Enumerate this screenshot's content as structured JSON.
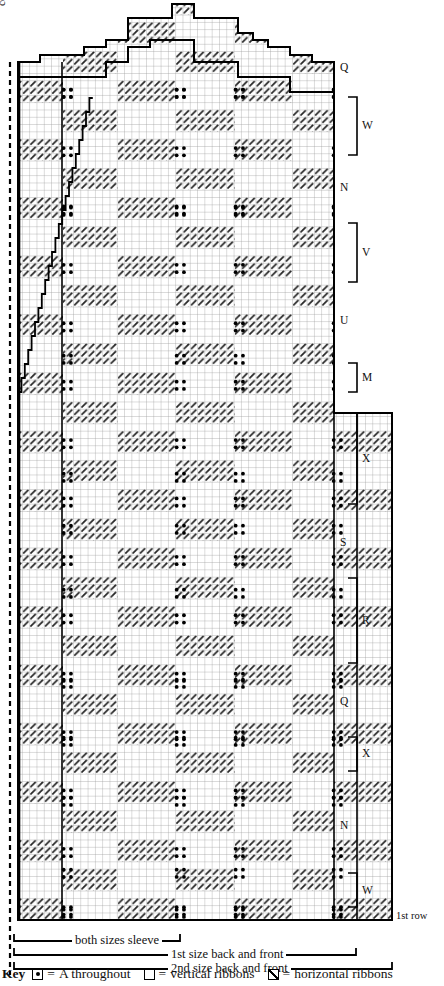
{
  "chart_title": "Knitting stitch chart - lattice ribbon pattern",
  "axis_labels": {
    "centre_stitch": "centre st",
    "first_row": "1st row"
  },
  "side_labels": [
    {
      "text": "Q",
      "y": 68,
      "bracket": false
    },
    {
      "text": "W",
      "y": 126,
      "bracket": true,
      "top": 96,
      "bottom": 156
    },
    {
      "text": "N",
      "y": 188,
      "bracket": false
    },
    {
      "text": "V",
      "y": 253,
      "bracket": true,
      "top": 222,
      "bottom": 283
    },
    {
      "text": "U",
      "y": 321,
      "bracket": false
    },
    {
      "text": "M",
      "y": 378,
      "bracket": true,
      "top": 362,
      "bottom": 393
    },
    {
      "text": "X",
      "y": 459,
      "bracket": true,
      "top": 412,
      "bottom": 505
    },
    {
      "text": "S",
      "y": 543,
      "bracket": false
    },
    {
      "text": "R",
      "y": 621,
      "bracket": true,
      "top": 577,
      "bottom": 664
    },
    {
      "text": "Q",
      "y": 702,
      "bracket": false
    },
    {
      "text": "X",
      "y": 754,
      "bracket": true,
      "top": 736,
      "bottom": 772
    },
    {
      "text": "N",
      "y": 826,
      "bracket": false
    },
    {
      "text": "W",
      "y": 891,
      "bracket": true,
      "top": 872,
      "bottom": 908
    }
  ],
  "span_captions": [
    {
      "text": "both sizes sleeve",
      "y": 941
    },
    {
      "text": "1st size back and front",
      "y": 955
    },
    {
      "text": "2nd size back and front",
      "y": 969
    }
  ],
  "key": {
    "label": "Key",
    "entries": [
      {
        "symbol": "square-with-centre-dot",
        "equals": "=",
        "text": "A throughout"
      },
      {
        "symbol": "empty-square",
        "equals": "=",
        "text": "vertical ribbons"
      },
      {
        "symbol": "square-with-diagonal",
        "equals": "=",
        "text": "horizontal ribbons"
      }
    ]
  },
  "chart_data": {
    "type": "heatmap",
    "xlabel": "stitches",
    "ylabel": "rows",
    "cell_size_px": 7.3,
    "grid": true,
    "legend_position": "bottom",
    "cell_types": [
      "plain",
      "horizontal-ribbon",
      "dot"
    ],
    "colors": {
      "grid_line": "#8d8d8d",
      "outline": "#000000",
      "hatch": "#2b2b2b",
      "dot": "#000000",
      "background": "#ffffff"
    },
    "geometry": {
      "left_edge_x": 18,
      "right_edge_narrow_x": 334,
      "right_edge_wide_x": 392,
      "bottom_y": 920,
      "top_y": 4,
      "widen_row_y": 413,
      "cols_narrow": 43,
      "cols_wide": 51,
      "rows": 125
    },
    "dot_block_columns": [
      60,
      173,
      232,
      330
    ],
    "dot_block_rows": [
      86,
      204,
      352,
      470,
      522,
      586,
      676,
      734,
      794,
      866,
      906
    ],
    "ribbon_band_period_rows": 8
  }
}
